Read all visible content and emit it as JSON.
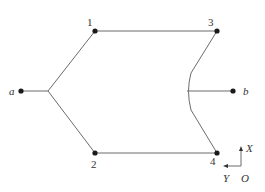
{
  "diagram": {
    "colors": {
      "line": "#6b6b6b",
      "node": "#1a1a1a",
      "text": "#333333"
    },
    "terminals": [
      {
        "id": "a",
        "label": "a",
        "x": 21,
        "y": 91
      },
      {
        "id": "b",
        "label": "b",
        "x": 233,
        "y": 91
      }
    ],
    "nodes": [
      {
        "id": "1",
        "label": "1",
        "x": 95,
        "y": 31
      },
      {
        "id": "2",
        "label": "2",
        "x": 95,
        "y": 153
      },
      {
        "id": "3",
        "label": "3",
        "x": 217,
        "y": 31
      },
      {
        "id": "4",
        "label": "4",
        "x": 217,
        "y": 153
      }
    ],
    "junctions": [
      {
        "id": "left-junction",
        "x": 48,
        "y": 91
      },
      {
        "id": "right-junction",
        "x": 187,
        "y": 91
      }
    ],
    "axes": {
      "x_label": "X",
      "y_label": "Y",
      "origin_label": "O"
    }
  }
}
